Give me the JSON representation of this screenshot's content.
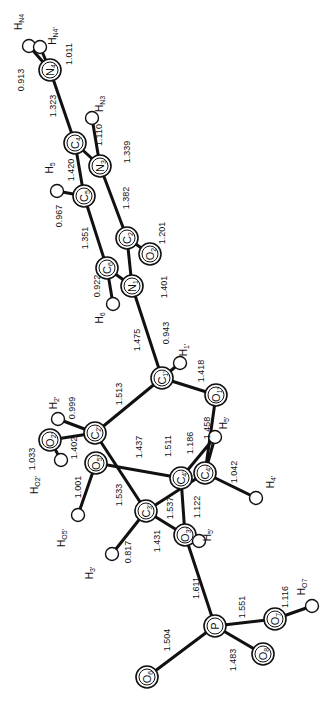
{
  "diagram": {
    "type": "molecular-structure",
    "orientation": "rotated-90",
    "atoms": [
      {
        "id": "HN4",
        "label": "H",
        "sub": "N4",
        "x": 29,
        "y": 46,
        "kind": "H",
        "lx": 22,
        "ly": 22
      },
      {
        "id": "HN4p",
        "label": "H",
        "sub": "N4'",
        "x": 40,
        "y": 47,
        "kind": "H",
        "lx": 56,
        "ly": 36
      },
      {
        "id": "N4",
        "label": "N",
        "sub": "4",
        "x": 50,
        "y": 70,
        "kind": "big"
      },
      {
        "id": "HN3",
        "label": "H",
        "sub": "N3",
        "x": 92,
        "y": 118,
        "kind": "H",
        "lx": 103,
        "ly": 104
      },
      {
        "id": "C4",
        "label": "C",
        "sub": "4",
        "x": 75,
        "y": 143,
        "kind": "big"
      },
      {
        "id": "N3",
        "label": "N",
        "sub": "3",
        "x": 100,
        "y": 166,
        "kind": "big"
      },
      {
        "id": "H5",
        "label": "H",
        "sub": "5",
        "x": 57,
        "y": 191,
        "kind": "H",
        "lx": 53,
        "ly": 168
      },
      {
        "id": "C5",
        "label": "C",
        "sub": "5",
        "x": 84,
        "y": 196,
        "kind": "big"
      },
      {
        "id": "C2",
        "label": "C",
        "sub": "2",
        "x": 127,
        "y": 238,
        "kind": "big"
      },
      {
        "id": "O2",
        "label": "O",
        "sub": "2",
        "x": 150,
        "y": 254,
        "kind": "big"
      },
      {
        "id": "C6",
        "label": "C",
        "sub": "6",
        "x": 107,
        "y": 268,
        "kind": "big"
      },
      {
        "id": "N1",
        "label": "N",
        "sub": "1",
        "x": 132,
        "y": 286,
        "kind": "big"
      },
      {
        "id": "H6",
        "label": "H",
        "sub": "6",
        "x": 113,
        "y": 304,
        "kind": "H",
        "lx": 103,
        "ly": 318
      },
      {
        "id": "C1p",
        "label": "C",
        "sub": "1'",
        "x": 162,
        "y": 378,
        "kind": "big"
      },
      {
        "id": "H1p",
        "label": "H",
        "sub": "1'",
        "x": 180,
        "y": 363,
        "kind": "H",
        "lx": 187,
        "ly": 350
      },
      {
        "id": "O1p",
        "label": "O",
        "sub": "1'",
        "x": 216,
        "y": 395,
        "kind": "big"
      },
      {
        "id": "H2p",
        "label": "H",
        "sub": "2'",
        "x": 58,
        "y": 419,
        "kind": "H",
        "lx": 57,
        "ly": 403
      },
      {
        "id": "C2p",
        "label": "C",
        "sub": "2'",
        "x": 95,
        "y": 433,
        "kind": "big"
      },
      {
        "id": "O2p",
        "label": "O",
        "sub": "2'",
        "x": 50,
        "y": 440,
        "kind": "big"
      },
      {
        "id": "HO2p",
        "label": "H",
        "sub": "O2'",
        "x": 61,
        "y": 460,
        "kind": "H",
        "lx": 38,
        "ly": 485
      },
      {
        "id": "H5p",
        "label": "H",
        "sub": "5'",
        "x": 215,
        "y": 437,
        "kind": "H",
        "lx": 227,
        "ly": 423
      },
      {
        "id": "O5p",
        "label": "O",
        "sub": "5'",
        "x": 96,
        "y": 463,
        "kind": "big"
      },
      {
        "id": "C4pL",
        "label": "C",
        "sub": "4'",
        "x": 181,
        "y": 478,
        "kind": "big"
      },
      {
        "id": "C4p",
        "label": "C",
        "sub": "4'",
        "x": 205,
        "y": 473,
        "kind": "big"
      },
      {
        "id": "H4p",
        "label": "H",
        "sub": "4'",
        "x": 256,
        "y": 498,
        "kind": "H",
        "lx": 274,
        "ly": 482
      },
      {
        "id": "C3p",
        "label": "C",
        "sub": "3'",
        "x": 146,
        "y": 511,
        "kind": "big"
      },
      {
        "id": "HO5p",
        "label": "H",
        "sub": "O5'",
        "x": 78,
        "y": 515,
        "kind": "H",
        "lx": 65,
        "ly": 538
      },
      {
        "id": "O3p",
        "label": "O",
        "sub": "3'",
        "x": 185,
        "y": 535,
        "kind": "big"
      },
      {
        "id": "H5pp",
        "label": "H",
        "sub": "5'",
        "x": 199,
        "y": 541,
        "kind": "H",
        "lx": 211,
        "ly": 535
      },
      {
        "id": "H3p",
        "label": "H",
        "sub": "3'",
        "x": 112,
        "y": 554,
        "kind": "H",
        "lx": 93,
        "ly": 573
      },
      {
        "id": "P",
        "label": "P",
        "sub": "",
        "x": 215,
        "y": 626,
        "kind": "big"
      },
      {
        "id": "O7",
        "label": "O",
        "sub": "7",
        "x": 275,
        "y": 619,
        "kind": "big"
      },
      {
        "id": "HO7",
        "label": "H",
        "sub": "O7",
        "x": 312,
        "y": 606,
        "kind": "H",
        "lx": 305,
        "ly": 587
      },
      {
        "id": "O8",
        "label": "O",
        "sub": "8",
        "x": 263,
        "y": 654,
        "kind": "big"
      },
      {
        "id": "O6",
        "label": "O",
        "sub": "6",
        "x": 147,
        "y": 677,
        "kind": "big"
      }
    ],
    "bonds": [
      {
        "from": "N4",
        "to": "HN4",
        "length": "0.913",
        "lx": 24,
        "ly": 80
      },
      {
        "from": "N4",
        "to": "HN4p",
        "length": "1.011",
        "lx": 72,
        "ly": 54
      },
      {
        "from": "N4",
        "to": "C4",
        "length": "1.323",
        "lx": 56,
        "ly": 106
      },
      {
        "from": "N3",
        "to": "HN3",
        "length": "1.110",
        "lx": 102,
        "ly": 135
      },
      {
        "from": "C4",
        "to": "N3",
        "length": "1.339",
        "lx": 130,
        "ly": 152
      },
      {
        "from": "C4",
        "to": "C5",
        "length": "1.420",
        "lx": 74,
        "ly": 170
      },
      {
        "from": "C5",
        "to": "H5",
        "length": "0.967",
        "lx": 62,
        "ly": 216
      },
      {
        "from": "N3",
        "to": "C2",
        "length": "1.382",
        "lx": 129,
        "ly": 198
      },
      {
        "from": "C2",
        "to": "O2",
        "length": "1.201",
        "lx": 165,
        "ly": 233
      },
      {
        "from": "C5",
        "to": "C6",
        "length": "1.351",
        "lx": 88,
        "ly": 238
      },
      {
        "from": "C6",
        "to": "N1",
        "length": "",
        "lx": 0,
        "ly": 0
      },
      {
        "from": "C2",
        "to": "N1",
        "length": "1.401",
        "lx": 167,
        "ly": 287
      },
      {
        "from": "C6",
        "to": "H6",
        "length": "0.922",
        "lx": 100,
        "ly": 286
      },
      {
        "from": "N1",
        "to": "C1p",
        "length": "1.475",
        "lx": 140,
        "ly": 340
      },
      {
        "from": "C1p",
        "to": "H1p",
        "length": "0.943",
        "lx": 169,
        "ly": 333
      },
      {
        "from": "C1p",
        "to": "O1p",
        "length": "1.418",
        "lx": 204,
        "ly": 371
      },
      {
        "from": "C1p",
        "to": "C2p",
        "length": "1.513",
        "lx": 122,
        "ly": 394
      },
      {
        "from": "C2p",
        "to": "H2p",
        "length": "0.999",
        "lx": 75,
        "ly": 408
      },
      {
        "from": "C2p",
        "to": "O2p",
        "length": "1.402",
        "lx": 77,
        "ly": 448
      },
      {
        "from": "O2p",
        "to": "HO2p",
        "length": "1.033",
        "lx": 35,
        "ly": 459
      },
      {
        "from": "O1p",
        "to": "C4p",
        "length": "1.458",
        "lx": 210,
        "ly": 428
      },
      {
        "from": "C4pL",
        "to": "O5p",
        "length": "1.437",
        "lx": 142,
        "ly": 447
      },
      {
        "from": "C4p",
        "to": "H5p",
        "length": "1.511",
        "lx": 171,
        "ly": 446
      },
      {
        "from": "C4pL",
        "to": "H5p",
        "length": "1.186",
        "lx": 193,
        "ly": 443
      },
      {
        "from": "C4p",
        "to": "H4p",
        "length": "1.042",
        "lx": 237,
        "ly": 472
      },
      {
        "from": "O5p",
        "to": "HO5p",
        "length": "1.001",
        "lx": 81,
        "ly": 487
      },
      {
        "from": "C2p",
        "to": "C3p",
        "length": "1.533",
        "lx": 122,
        "ly": 495
      },
      {
        "from": "C3p",
        "to": "C4p",
        "length": "1.537",
        "lx": 173,
        "ly": 508
      },
      {
        "from": "C4pL",
        "to": "O3p",
        "length": "1.122",
        "lx": 200,
        "ly": 507
      },
      {
        "from": "C3p",
        "to": "O3p",
        "length": "1.431",
        "lx": 160,
        "ly": 541
      },
      {
        "from": "C3p",
        "to": "H3p",
        "length": "0.817",
        "lx": 131,
        "ly": 552
      },
      {
        "from": "O3p",
        "to": "P",
        "length": "1.611",
        "lx": 199,
        "ly": 588
      },
      {
        "from": "P",
        "to": "O7",
        "length": "1.551",
        "lx": 245,
        "ly": 607
      },
      {
        "from": "O7",
        "to": "HO7",
        "length": "1.116",
        "lx": 288,
        "ly": 597
      },
      {
        "from": "P",
        "to": "O8",
        "length": "1.483",
        "lx": 236,
        "ly": 660
      },
      {
        "from": "P",
        "to": "O6",
        "length": "1.504",
        "lx": 170,
        "ly": 640
      }
    ]
  }
}
